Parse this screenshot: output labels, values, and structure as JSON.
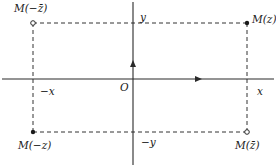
{
  "diagram": {
    "origin_label": "O",
    "axis_labels": {
      "x_positive": "x",
      "x_negative": "−x",
      "y_positive": "y",
      "y_negative": "−y"
    },
    "points": [
      {
        "id": "M_neg_conj_z",
        "label": "M(−z̄)",
        "style": "hollow",
        "x": 33,
        "y": 23
      },
      {
        "id": "M_z",
        "label": "M(z)",
        "style": "filled",
        "x": 247,
        "y": 23
      },
      {
        "id": "M_neg_z",
        "label": "M(−z)",
        "style": "filled",
        "x": 33,
        "y": 132
      },
      {
        "id": "M_conj_z",
        "label": "M(z̄)",
        "style": "hollow",
        "x": 247,
        "y": 132
      }
    ],
    "colors": {
      "stroke": "#2a2a2a",
      "dash": "#333333"
    }
  }
}
